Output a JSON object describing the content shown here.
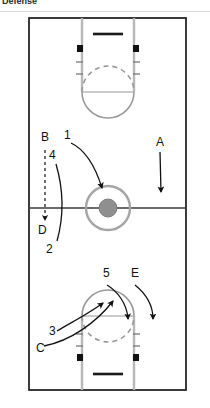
{
  "header": {
    "title": "Defense"
  },
  "diagram": {
    "name": "basketball-full-court-defense-diagram",
    "type": "play-diagram",
    "sport": "basketball",
    "court": {
      "x": 29,
      "y": 18,
      "width": 157,
      "height": 372,
      "line_color": "#1a1a1a",
      "line_width": 1.6,
      "fill": "#ffffff",
      "center_line_y": 208
    },
    "center_circle": {
      "cx": 108,
      "cy": 208,
      "outer_r": 22,
      "inner_r": 9,
      "ring_color": "#9a9a9a",
      "inner_fill": "#8f8f8f"
    },
    "keys": [
      {
        "name": "top-key",
        "lane_left_x": 82,
        "lane_right_x": 134,
        "baseline_y": 18,
        "free_throw_y": 92,
        "circle_r": 26,
        "backboard": {
          "x1": 93,
          "x2": 123,
          "y": 34
        },
        "blocks": [
          {
            "x": 79,
            "y": 48
          },
          {
            "x": 131,
            "y": 48
          }
        ],
        "hash_rows": [
          62,
          74
        ],
        "lane_color": "#b8b8b8",
        "arc_color": "#9a9a9a"
      },
      {
        "name": "bottom-key",
        "lane_left_x": 82,
        "lane_right_x": 134,
        "baseline_y": 390,
        "free_throw_y": 316,
        "circle_r": 26,
        "backboard": {
          "x1": 93,
          "x2": 123,
          "y": 374
        },
        "blocks": [
          {
            "x": 79,
            "y": 356
          },
          {
            "x": 131,
            "y": 356
          }
        ],
        "hash_rows": [
          346,
          334
        ],
        "lane_color": "#b8b8b8",
        "arc_color": "#9a9a9a"
      }
    ],
    "labels": [
      {
        "id": "label-B",
        "text": "B",
        "x": 41,
        "y": 141,
        "role": "defender"
      },
      {
        "id": "label-1",
        "text": "1",
        "x": 64,
        "y": 139,
        "role": "offense"
      },
      {
        "id": "label-4",
        "text": "4",
        "x": 49,
        "y": 159,
        "role": "offense"
      },
      {
        "id": "label-A",
        "text": "A",
        "x": 156,
        "y": 146,
        "role": "defender"
      },
      {
        "id": "label-D",
        "text": "D",
        "x": 38,
        "y": 234,
        "role": "defender"
      },
      {
        "id": "label-2",
        "text": "2",
        "x": 46,
        "y": 253,
        "role": "offense"
      },
      {
        "id": "label-5",
        "text": "5",
        "x": 103,
        "y": 277,
        "role": "offense"
      },
      {
        "id": "label-E",
        "text": "E",
        "x": 131,
        "y": 277,
        "role": "defender"
      },
      {
        "id": "label-3",
        "text": "3",
        "x": 49,
        "y": 335,
        "role": "offense"
      },
      {
        "id": "label-C",
        "text": "C",
        "x": 36,
        "y": 352,
        "role": "defender"
      }
    ],
    "arrows": [
      {
        "id": "arrow-B-dashed",
        "style": "dashed",
        "from_label": "B",
        "to": "D",
        "path": "M 45,148 L 45,208 L 45,222",
        "head": "down"
      },
      {
        "id": "arrow-1-curve",
        "style": "solid",
        "from_label": "1",
        "to": "center-circle",
        "path": "M 70,142 C 86,150 96,172 101,190",
        "head": "down-right"
      },
      {
        "id": "arrow-4-curve",
        "style": "solid",
        "from_label": "4",
        "to": "2",
        "path": "M 56,163 C 62,186 64,214 58,240",
        "head": "none"
      },
      {
        "id": "arrow-A-down",
        "style": "solid",
        "from_label": "A",
        "to": "half-court",
        "path": "M 160,152 L 161,195",
        "head": "down"
      },
      {
        "id": "arrow-5-curve",
        "style": "solid",
        "from_label": "5",
        "to": "bottom-wing",
        "path": "M 106,284 C 116,290 126,302 127,322",
        "head": "down"
      },
      {
        "id": "arrow-E-curve",
        "style": "solid",
        "from_label": "E",
        "to": "bottom-corner",
        "path": "M 134,284 C 144,292 152,304 152,322",
        "head": "down"
      },
      {
        "id": "arrow-3-to-lane",
        "style": "solid",
        "from_label": "3",
        "to": "free-throw-line",
        "path": "M 56,330 C 74,320 92,310 104,302",
        "head": "up-right"
      },
      {
        "id": "arrow-C-to-lane",
        "style": "solid",
        "from_label": "C",
        "to": "free-throw-circle",
        "path": "M 44,345 C 70,340 96,322 112,300",
        "head": "up-right"
      }
    ]
  }
}
